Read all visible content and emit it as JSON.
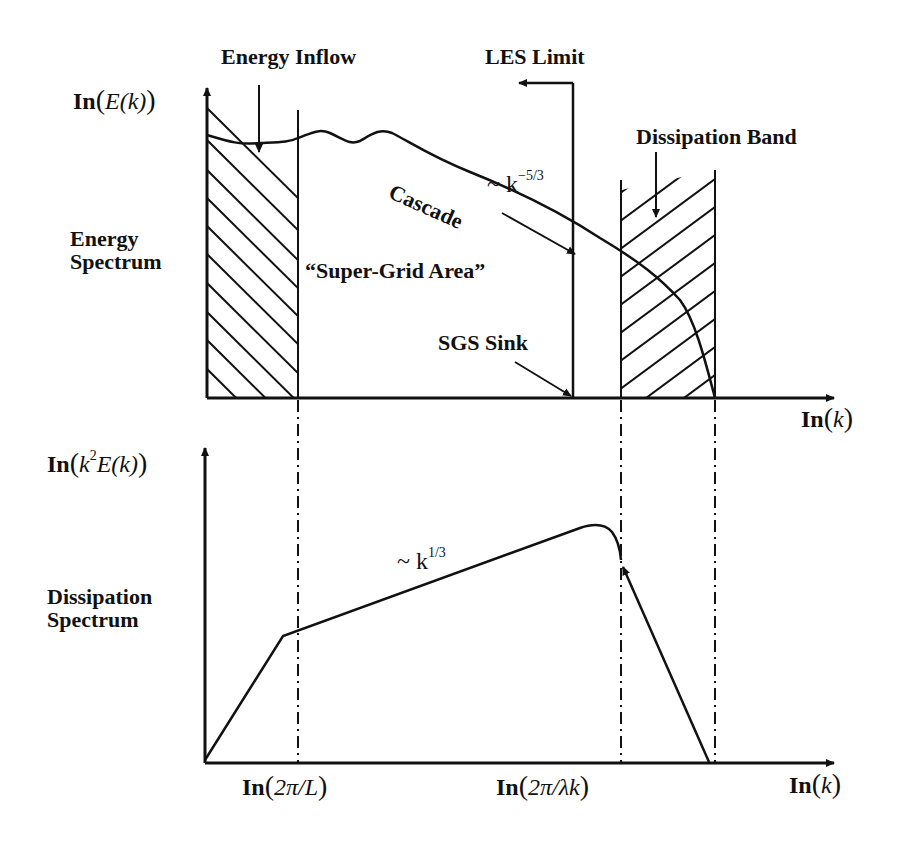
{
  "diagram": {
    "top_panel": {
      "y_axis_label": {
        "fn": "In",
        "expr": "E(k)"
      },
      "x_axis_label": {
        "fn": "In",
        "expr": "k"
      },
      "side_label_line1": "Energy",
      "side_label_line2": "Spectrum",
      "annotations": {
        "energy_inflow": "Energy Inflow",
        "les_limit": "LES Limit",
        "dissipation_band": "Dissipation Band",
        "cascade": "Cascade",
        "slope": "~ k",
        "slope_exp": "−5/3",
        "super_grid": "“Super-Grid Area”",
        "sgs_sink": "SGS Sink"
      }
    },
    "bottom_panel": {
      "y_axis_label": {
        "fn": "In",
        "expr_k": "k",
        "expr_sup": "2",
        "expr_rest": "E(k)"
      },
      "x_axis_label": {
        "fn": "In",
        "expr": "k"
      },
      "side_label_line1": "Dissipation",
      "side_label_line2": "Spectrum",
      "slope": "~ k",
      "slope_exp": "1/3",
      "tick_left": {
        "fn": "In",
        "expr": "2π/L"
      },
      "tick_right": {
        "fn": "In",
        "expr": "2π/λk"
      }
    }
  },
  "colors": {
    "ink": "#111111",
    "background": "#ffffff"
  }
}
